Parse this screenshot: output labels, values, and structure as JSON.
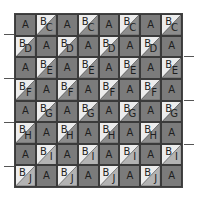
{
  "colors": {
    "patch_a": "#7b7b7b",
    "triangle_b": "#ececec",
    "grid_line": "#3a3a3a"
  },
  "triangle_colors": {
    "C": "#8d8d8d",
    "D": "#8d8d8d",
    "E": "#8d8d8d",
    "F": "#8d8d8d",
    "G": "#8d8d8d",
    "H": "#8d8d8d",
    "I": "#b3b3b3",
    "J": "#b3b3b3"
  },
  "rows": [
    {
      "letter": "C",
      "cells": [
        "A",
        "BC",
        "A",
        "BC",
        "A",
        "BC",
        "A",
        "BC"
      ]
    },
    {
      "letter": "D",
      "cells": [
        "BD",
        "A",
        "BD",
        "A",
        "BD",
        "A",
        "BD",
        "A"
      ]
    },
    {
      "letter": "E",
      "cells": [
        "A",
        "BE",
        "A",
        "BE",
        "A",
        "BE",
        "A",
        "BE"
      ]
    },
    {
      "letter": "F",
      "cells": [
        "BF",
        "A",
        "BF",
        "A",
        "BF",
        "A",
        "BF",
        "A"
      ]
    },
    {
      "letter": "G",
      "cells": [
        "A",
        "BG",
        "A",
        "BG",
        "A",
        "BG",
        "A",
        "BG"
      ]
    },
    {
      "letter": "H",
      "cells": [
        "BH",
        "A",
        "BH",
        "A",
        "BH",
        "A",
        "BH",
        "A"
      ]
    },
    {
      "letter": "I",
      "cells": [
        "A",
        "BI",
        "A",
        "BI",
        "A",
        "BI",
        "A",
        "BI"
      ]
    },
    {
      "letter": "J",
      "cells": [
        "BJ",
        "A",
        "BJ",
        "A",
        "BJ",
        "A",
        "BJ",
        "A"
      ]
    }
  ],
  "labels": {
    "square": "A",
    "triangle_top": "B"
  },
  "ticks": {
    "left_y": [
      34,
      78,
      122,
      166
    ],
    "right_y": [
      56,
      100,
      144
    ]
  }
}
